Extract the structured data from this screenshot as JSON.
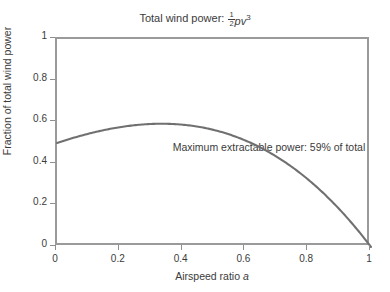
{
  "title": {
    "text_prefix": "Total wind power:",
    "formula_numerator": "1",
    "formula_denominator": "2",
    "formula_body": "pv",
    "formula_exponent": "3",
    "full_text": "Total wind power: 1/2 pv^3"
  },
  "annotation": {
    "text": "Maximum extractable power: 59% of total"
  },
  "axes": {
    "xlabel_text": "Airspeed ratio",
    "xlabel_variable": "a",
    "ylabel": "Fraction of total wind power",
    "xticks": [
      "0",
      "0.2",
      "0.4",
      "0.6",
      "0.8",
      "1"
    ],
    "yticks": [
      "0",
      "0.2",
      "0.4",
      "0.6",
      "0.8",
      "1"
    ]
  },
  "colors": {
    "curve": "#707070",
    "frame": "#9a9a9a",
    "text": "#3b3b3b",
    "background": "#ffffff"
  },
  "chart_data": {
    "type": "line",
    "xlabel": "Airspeed ratio a",
    "ylabel": "Fraction of total wind power",
    "xlim": [
      0,
      1
    ],
    "ylim": [
      0,
      1
    ],
    "xticks": [
      0,
      0.2,
      0.4,
      0.6,
      0.8,
      1
    ],
    "yticks": [
      0,
      0.2,
      0.4,
      0.6,
      0.8,
      1
    ],
    "grid": false,
    "legend": "none",
    "annotations": [
      {
        "text": "Maximum extractable power: 59% of total",
        "x": 0.5,
        "y": 0.69
      }
    ],
    "series": [
      {
        "name": "Betz power fraction",
        "formula": "0.5*(1-a^2)*(1+a)",
        "x": [
          0.0,
          0.02,
          0.05,
          0.1,
          0.15,
          0.2,
          0.25,
          0.3,
          0.3333,
          0.35,
          0.4,
          0.45,
          0.5,
          0.55,
          0.6,
          0.65,
          0.7,
          0.75,
          0.8,
          0.85,
          0.9,
          0.95,
          1.0
        ],
        "y": [
          0.0,
          0.02,
          0.0524,
          0.1045,
          0.1563,
          0.2075,
          0.2578,
          0.3071,
          0.3395,
          0.3549,
          0.4014,
          0.4461,
          0.4888,
          0.529,
          0.5664,
          0.6005,
          0.6307,
          0.6565,
          0.6771,
          0.6919,
          0.7,
          0.7002,
          0.0
        ]
      }
    ],
    "curve_values": {
      "peak_x": 0.3333,
      "peak_y": 0.5926,
      "peak_label": "59%",
      "endpoint_left": [
        0.0,
        0.0
      ],
      "endpoint_right": [
        1.0,
        0.0
      ]
    }
  }
}
